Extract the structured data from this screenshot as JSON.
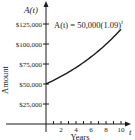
{
  "chart_data": {
    "type": "line",
    "title": "",
    "equation_label": "A(t) = 50,000(1.09)",
    "equation_exponent": "t",
    "y_axis_name": "A(t)",
    "ylabel": "Amount",
    "xlabel": "Years",
    "x_axis_name": "t",
    "x_ticks": [
      "2",
      "4",
      "6",
      "8",
      "10"
    ],
    "x_minor_ticks": [
      1,
      2,
      3,
      4,
      5,
      6,
      7,
      8,
      9,
      10
    ],
    "y_ticks": [
      "$25,000",
      "$50,000",
      "$75,000",
      "$100,000",
      "$125,000"
    ],
    "y_tick_values": [
      25000,
      50000,
      75000,
      100000,
      125000
    ],
    "xlim": [
      0,
      10.5
    ],
    "ylim": [
      0,
      140000
    ],
    "grid": false,
    "legend": "none",
    "series": [
      {
        "name": "A(t) = 50,000(1.09)^t",
        "x": [
          0,
          1,
          2,
          3,
          4,
          5,
          6,
          7,
          8,
          9,
          10
        ],
        "values": [
          50000,
          54500,
          59405,
          64751,
          70579,
          76931,
          83855,
          91402,
          99628,
          108595,
          118368
        ]
      }
    ]
  }
}
